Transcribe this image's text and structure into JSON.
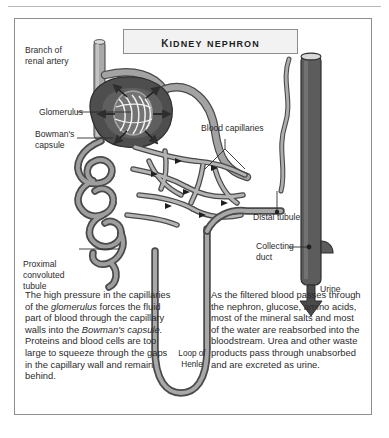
{
  "figure": {
    "title": "Kidney nephron",
    "labels": {
      "branch_renal_artery": "Branch of\nrenal artery",
      "glomerulus": "Glomerulus",
      "bowmans_capsule": "Bowman's\ncapsule",
      "blood_capillaries": "Blood capillaries",
      "distal_tubule": "Distal tubule",
      "collecting_duct": "Collecting\nduct",
      "urine": "Urine",
      "proximal_convoluted_tubule": "Proximal\nconvoluted\ntubule",
      "loop_of_henle": "Loop of\nHenle"
    },
    "paragraph_left": {
      "seg1": "The high pressure in the capillaries of the ",
      "em1": "glomerulus",
      "seg2": " forces the fluid part of blood through the capillary walls into the ",
      "em2": "Bowman's capsule.",
      "seg3": " Proteins and blood cells are too large to squeeze through the gaps in the capillary wall and remain behind."
    },
    "paragraph_right": {
      "text": "As the filtered blood passes through the nephron, glucose, amino acids, most of the mineral salts and most of the water are reabsorbed into the bloodstream. Urea and other waste products pass through unabsorbed and are excreted as urine."
    },
    "colors": {
      "vessel_light": "#b9b9b9",
      "vessel_mid": "#8f8f8f",
      "vessel_dark": "#5e5e5e",
      "capsule_dark": "#4a4a4a",
      "duct_dark": "#5a5a5a",
      "outline": "#3a3a3a",
      "border": "#8d8d8d",
      "plate_fill": "#f2f2f2",
      "text": "#2b2b2b"
    }
  }
}
